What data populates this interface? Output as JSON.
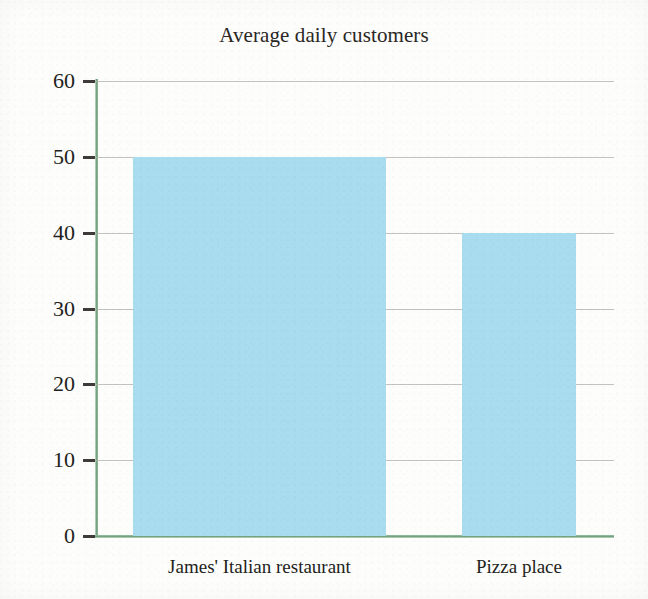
{
  "chart_data": {
    "type": "bar",
    "title": "Average daily customers",
    "xlabel": "",
    "ylabel": "",
    "categories": [
      "James' Italian restaurant",
      "Pizza place"
    ],
    "values": [
      50,
      40
    ],
    "ylim": [
      0,
      60
    ],
    "ytick_labels": [
      "0",
      "10",
      "20",
      "30",
      "40",
      "50",
      "60"
    ],
    "ytick_values": [
      0,
      10,
      20,
      30,
      40,
      50,
      60
    ],
    "grid": true,
    "legend": false,
    "legend_position": "none",
    "bar_color": "#a8dcee",
    "axis_color": "#6f9f7c",
    "gridline_color": "#b9b7b4",
    "text_color": "#231f20",
    "background_color": "#fdfdfc"
  }
}
